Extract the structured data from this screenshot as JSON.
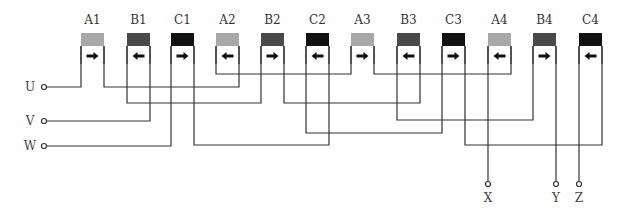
{
  "diagram": {
    "colors": {
      "A": "#a8a8a8",
      "B": "#4a4a4a",
      "C": "#111111",
      "wire": "#333333"
    },
    "coils": [
      {
        "label": "A1",
        "phase": "A",
        "direction": "right",
        "x": 81
      },
      {
        "label": "B1",
        "phase": "B",
        "direction": "left",
        "x": 127
      },
      {
        "label": "C1",
        "phase": "C",
        "direction": "right",
        "x": 171
      },
      {
        "label": "A2",
        "phase": "A",
        "direction": "left",
        "x": 216
      },
      {
        "label": "B2",
        "phase": "B",
        "direction": "right",
        "x": 261
      },
      {
        "label": "C2",
        "phase": "C",
        "direction": "left",
        "x": 306
      },
      {
        "label": "A3",
        "phase": "A",
        "direction": "right",
        "x": 351
      },
      {
        "label": "B3",
        "phase": "B",
        "direction": "left",
        "x": 397
      },
      {
        "label": "C3",
        "phase": "C",
        "direction": "right",
        "x": 442
      },
      {
        "label": "A4",
        "phase": "A",
        "direction": "left",
        "x": 488
      },
      {
        "label": "B4",
        "phase": "B",
        "direction": "right",
        "x": 533
      },
      {
        "label": "C4",
        "phase": "C",
        "direction": "left",
        "x": 579
      }
    ],
    "input_terminals": [
      {
        "label": "U",
        "y": 87
      },
      {
        "label": "V",
        "y": 121
      },
      {
        "label": "W",
        "y": 146
      }
    ],
    "output_terminals": [
      {
        "label": "X",
        "x": 488
      },
      {
        "label": "Y",
        "x": 556
      },
      {
        "label": "Z",
        "x": 579
      }
    ]
  }
}
